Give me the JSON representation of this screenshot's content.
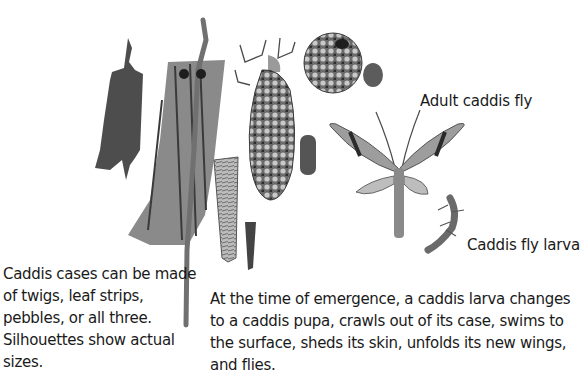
{
  "labels": {
    "adult": "Adult caddis fly",
    "larva": "Caddis fly larva"
  },
  "captions": {
    "cases": "Caddis cases can be made of twigs, leaf strips, pebbles, or all three. Silhouettes show actual sizes.",
    "emergence": "At the time of emergence, a caddis larva changes to a caddis pupa, crawls out of its case, swims to the surface, sheds its skin, unfolds its new wings, and flies."
  },
  "illustrations": [
    "leaf-case-silhouette-icon",
    "twig-case-icon",
    "pebble-case-larva-icon",
    "pebble-case-icon",
    "pebble-case-silhouette-icon",
    "cone-case-icon",
    "cone-case-silhouette-icon",
    "pebble-silhouette-icon",
    "adult-caddis-fly-icon",
    "caddis-larva-icon"
  ],
  "colors": {
    "background": "#ffffff",
    "ink": "#1a1a1a",
    "silhouette": "#555555"
  }
}
